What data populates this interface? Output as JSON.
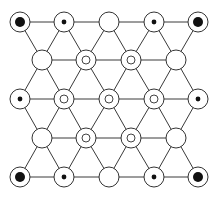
{
  "diagram": {
    "title": "",
    "colors": {
      "line": "#3a3a3a",
      "node_stroke": "#333333",
      "dot": "#111111",
      "background": "#ffffff"
    },
    "node_radius": 10,
    "node_types": {
      "big-dot": "circle containing a large filled dot",
      "small-dot": "circle containing a small filled dot",
      "ring": "circle containing a small open ring",
      "empty": "empty circle"
    },
    "rows": [
      {
        "y": 22,
        "nodes": [
          {
            "x": 20,
            "type": "big-dot"
          },
          {
            "x": 64,
            "type": "small-dot"
          },
          {
            "x": 109,
            "type": "empty"
          },
          {
            "x": 154,
            "type": "small-dot"
          },
          {
            "x": 198,
            "type": "big-dot"
          }
        ]
      },
      {
        "y": 60,
        "nodes": [
          {
            "x": 42,
            "type": "empty"
          },
          {
            "x": 86,
            "type": "ring"
          },
          {
            "x": 131,
            "type": "ring"
          },
          {
            "x": 176,
            "type": "empty"
          }
        ]
      },
      {
        "y": 99,
        "nodes": [
          {
            "x": 20,
            "type": "small-dot"
          },
          {
            "x": 64,
            "type": "ring"
          },
          {
            "x": 109,
            "type": "ring"
          },
          {
            "x": 154,
            "type": "ring"
          },
          {
            "x": 198,
            "type": "small-dot"
          }
        ]
      },
      {
        "y": 138,
        "nodes": [
          {
            "x": 42,
            "type": "empty"
          },
          {
            "x": 86,
            "type": "ring"
          },
          {
            "x": 131,
            "type": "ring"
          },
          {
            "x": 176,
            "type": "empty"
          }
        ]
      },
      {
        "y": 177,
        "nodes": [
          {
            "x": 20,
            "type": "big-dot"
          },
          {
            "x": 64,
            "type": "small-dot"
          },
          {
            "x": 109,
            "type": "empty"
          },
          {
            "x": 154,
            "type": "small-dot"
          },
          {
            "x": 198,
            "type": "big-dot"
          }
        ]
      }
    ]
  }
}
